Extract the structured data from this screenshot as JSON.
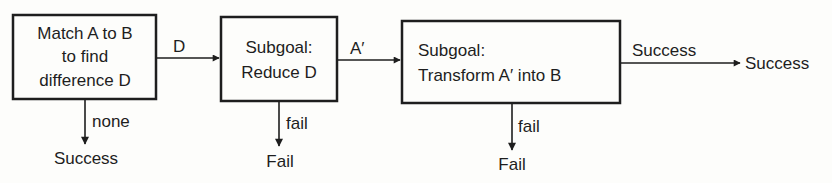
{
  "diagram": {
    "nodes": [
      {
        "id": "match",
        "lines": [
          "Match A to B",
          "to find",
          "difference D"
        ]
      },
      {
        "id": "reduce",
        "lines": [
          "Subgoal:",
          "Reduce D"
        ]
      },
      {
        "id": "transform",
        "lines": [
          "Subgoal:",
          "Transform A′ into B"
        ]
      }
    ],
    "edges": [
      {
        "from": "match",
        "to": "reduce",
        "label": "D"
      },
      {
        "from": "reduce",
        "to": "transform",
        "label": "A′"
      },
      {
        "from": "transform",
        "to": "success-final",
        "label": "Success"
      },
      {
        "from": "match",
        "to": "success-none",
        "label": "none"
      },
      {
        "from": "reduce",
        "to": "fail-reduce",
        "label": "fail"
      },
      {
        "from": "transform",
        "to": "fail-transform",
        "label": "fail"
      }
    ],
    "terminals": {
      "success_none": "Success",
      "fail_reduce": "Fail",
      "fail_transform": "Fail",
      "success_final": "Success"
    }
  }
}
